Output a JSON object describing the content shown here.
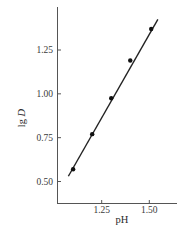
{
  "chart_data": {
    "type": "scatter",
    "title": "",
    "xlabel": "pH",
    "ylabel_main": "lg ",
    "ylabel_italic": "D",
    "xlim": [
      1.015,
      1.64
    ],
    "ylim": [
      0.43,
      1.55
    ],
    "xticks": [
      1.25,
      1.5
    ],
    "xtick_labels": [
      "1.25",
      "1.50"
    ],
    "yticks": [
      0.5,
      0.75,
      1.0,
      1.25
    ],
    "ytick_labels": [
      "0.50",
      "0.75",
      "1.00",
      "1.25"
    ],
    "grid": false,
    "legend": null,
    "series": [
      {
        "name": "measured",
        "type": "scatter",
        "x": [
          1.1,
          1.2,
          1.3,
          1.4,
          1.51
        ],
        "y": [
          0.57,
          0.77,
          0.975,
          1.19,
          1.37
        ]
      },
      {
        "name": "fit line",
        "type": "line",
        "x": [
          1.075,
          1.545
        ],
        "y": [
          0.53,
          1.425
        ]
      }
    ],
    "colors": {
      "axis": "#555555",
      "line": "#222222",
      "point": "#111111"
    }
  }
}
